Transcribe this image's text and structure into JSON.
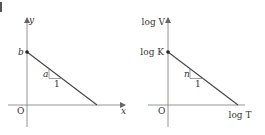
{
  "diagrams": [
    {
      "name": "linear-graph",
      "y_axis_label": "y",
      "x_axis_label": "x",
      "origin_label": "O",
      "intercept_label": "b",
      "slope_rise_label": "a",
      "slope_run_label": "1"
    },
    {
      "name": "log-log-graph",
      "y_axis_label": "log V",
      "x_axis_label": "log T",
      "origin_label": "O",
      "intercept_label": "log K",
      "slope_rise_label": "n",
      "slope_run_label": "1"
    }
  ]
}
